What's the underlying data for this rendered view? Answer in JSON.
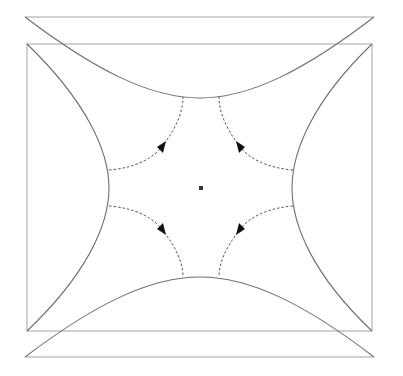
{
  "diagram": {
    "title": "",
    "colors": {
      "boundary": "#6e6e6e",
      "frame": "#9a9a9a",
      "flow": "#555555",
      "arrow": "#111111",
      "background": "#ffffff"
    },
    "elements": {
      "outer_top_line": "top horizontal line",
      "outer_bottom_line": "bottom horizontal line",
      "inner_frame": "rectangle",
      "curves": [
        "top-curve",
        "bottom-curve",
        "left-curve",
        "right-curve"
      ],
      "flow_lines": [
        "upper-left",
        "upper-right",
        "lower-left",
        "lower-right"
      ],
      "center_point": "small square marker"
    },
    "labels": []
  }
}
